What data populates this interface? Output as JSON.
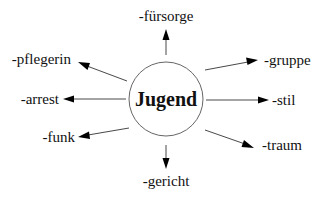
{
  "diagram": {
    "type": "radial-word-map",
    "center": {
      "label": "Jugend"
    },
    "branches": [
      {
        "id": "fuersorge",
        "label": "-fürsorge",
        "direction": "up"
      },
      {
        "id": "gruppe",
        "label": "-gruppe",
        "direction": "upper-right"
      },
      {
        "id": "stil",
        "label": "-stil",
        "direction": "right"
      },
      {
        "id": "traum",
        "label": "-traum",
        "direction": "lower-right"
      },
      {
        "id": "gericht",
        "label": "-gericht",
        "direction": "down"
      },
      {
        "id": "funk",
        "label": "-funk",
        "direction": "lower-left"
      },
      {
        "id": "arrest",
        "label": "-arrest",
        "direction": "left"
      },
      {
        "id": "pflegerin",
        "label": "-pflegerin",
        "direction": "upper-left"
      }
    ]
  }
}
